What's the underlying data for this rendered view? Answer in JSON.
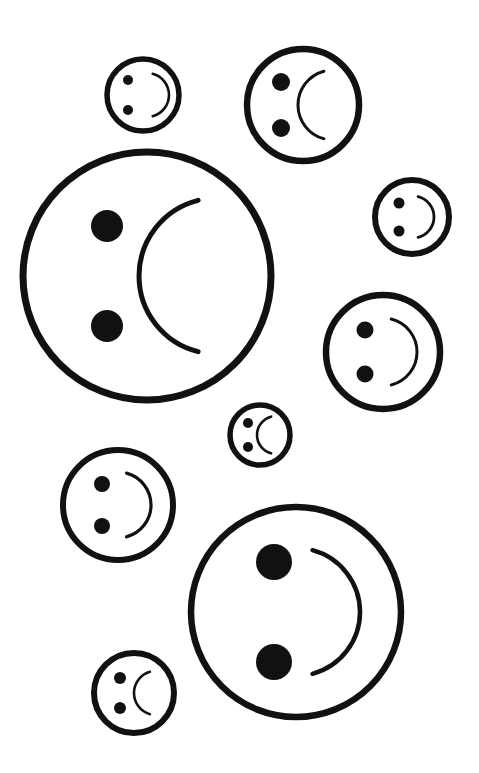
{
  "canvas": {
    "width": 479,
    "height": 773,
    "background_color": "#ffffff",
    "ink_color": "#111111"
  },
  "artwork": {
    "title": "Rotated smiley and frowny faces",
    "description": "Nine hand-drawn circular faces of varying sizes scattered across a white page; each face is rotated ninety degrees counter-clockwise so the two round eyes are stacked vertically on the left side and the curved mouth arc sits on the right side.",
    "face_count": 9,
    "smile_count": 5,
    "frown_count": 4,
    "orientation": "rotated-90-ccw"
  },
  "faces": [
    {
      "id": "face-1",
      "name": "small-top-left-face",
      "expression": "smile",
      "mouth_glyph": ")",
      "cx": 143,
      "cy": 95,
      "r": 36,
      "outline_width": 5.5,
      "eye_r": 5.0,
      "eye_offset_x": -15,
      "eye_offset_y": 15,
      "mouth_offset_x": 4,
      "mouth_r": 22,
      "mouth_width": 2.6,
      "mouth_sweep": 150
    },
    {
      "id": "face-2",
      "name": "top-right-face",
      "expression": "frown",
      "mouth_glyph": "(",
      "cx": 303,
      "cy": 105,
      "r": 56,
      "outline_width": 6.5,
      "eye_r": 9.0,
      "eye_offset_x": -22,
      "eye_offset_y": 23,
      "mouth_offset_x": 30,
      "mouth_r": 35,
      "mouth_width": 3.0,
      "mouth_sweep": 150
    },
    {
      "id": "face-3",
      "name": "large-top-left-face",
      "expression": "frown",
      "mouth_glyph": "(",
      "cx": 147,
      "cy": 276,
      "r": 124,
      "outline_width": 7.0,
      "eye_r": 16.0,
      "eye_offset_x": -40,
      "eye_offset_y": 50,
      "mouth_offset_x": 70,
      "mouth_r": 78,
      "mouth_width": 5.0,
      "mouth_sweep": 152
    },
    {
      "id": "face-4",
      "name": "small-right-face",
      "expression": "smile",
      "mouth_glyph": ")",
      "cx": 412,
      "cy": 217,
      "r": 37,
      "outline_width": 6.0,
      "eye_r": 5.5,
      "eye_offset_x": -13,
      "eye_offset_y": 14,
      "mouth_offset_x": 1,
      "mouth_r": 21,
      "mouth_width": 2.8,
      "mouth_sweep": 152
    },
    {
      "id": "face-5",
      "name": "mid-right-face",
      "expression": "smile",
      "mouth_glyph": ")",
      "cx": 383,
      "cy": 352,
      "r": 57,
      "outline_width": 6.5,
      "eye_r": 8.5,
      "eye_offset_x": -18,
      "eye_offset_y": 22,
      "mouth_offset_x": 0,
      "mouth_r": 34,
      "mouth_width": 3.0,
      "mouth_sweep": 152
    },
    {
      "id": "face-6",
      "name": "tiny-center-face",
      "expression": "frown",
      "mouth_glyph": "(",
      "cx": 260,
      "cy": 435,
      "r": 30,
      "outline_width": 5.5,
      "eye_r": 5.0,
      "eye_offset_x": -12,
      "eye_offset_y": 12,
      "mouth_offset_x": 16,
      "mouth_r": 19,
      "mouth_width": 2.6,
      "mouth_sweep": 150
    },
    {
      "id": "face-7",
      "name": "left-middle-face",
      "expression": "smile",
      "mouth_glyph": ")",
      "cx": 118,
      "cy": 505,
      "r": 55,
      "outline_width": 6.0,
      "eye_r": 8.0,
      "eye_offset_x": -16,
      "eye_offset_y": 21,
      "mouth_offset_x": 0,
      "mouth_r": 33,
      "mouth_width": 3.2,
      "mouth_sweep": 150
    },
    {
      "id": "face-8",
      "name": "bottom-left-small-face",
      "expression": "frown",
      "mouth_glyph": "(",
      "cx": 134,
      "cy": 693,
      "r": 40,
      "outline_width": 6.0,
      "eye_r": 6.0,
      "eye_offset_x": -14,
      "eye_offset_y": 15,
      "mouth_offset_x": 22,
      "mouth_r": 22,
      "mouth_width": 2.6,
      "mouth_sweep": 148
    },
    {
      "id": "face-9",
      "name": "large-bottom-right-face",
      "expression": "smile",
      "mouth_glyph": ")",
      "cx": 296,
      "cy": 612,
      "r": 105,
      "outline_width": 6.5,
      "eye_r": 18.0,
      "eye_offset_x": -22,
      "eye_offset_y": 50,
      "mouth_offset_x": 0,
      "mouth_r": 64,
      "mouth_width": 4.5,
      "mouth_sweep": 150
    }
  ]
}
